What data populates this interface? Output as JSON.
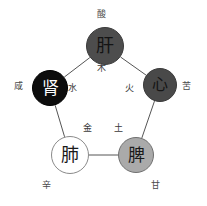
{
  "diagram": {
    "type": "pentagon-cycle",
    "background_color": "#ffffff",
    "line_color": "#555555",
    "nodes": [
      {
        "id": "liver",
        "organ": "肝",
        "element": "木",
        "taste": "酸",
        "fill": "#4d4d4d",
        "text_color": "#141414",
        "stroke": "#3a3a3a",
        "cx": 105,
        "cy": 46,
        "r": 19
      },
      {
        "id": "heart",
        "organ": "心",
        "element": "火",
        "taste": "苦",
        "fill": "#494949",
        "text_color": "#151515",
        "stroke": "#3a3a3a",
        "cx": 160,
        "cy": 85,
        "r": 17
      },
      {
        "id": "spleen",
        "organ": "脾",
        "element": "土",
        "taste": "甘",
        "fill": "#aaaaaa",
        "text_color": "#1a1a1a",
        "stroke": "#707070",
        "cx": 136,
        "cy": 155,
        "r": 18
      },
      {
        "id": "lung",
        "organ": "肺",
        "element": "金",
        "taste": "辛",
        "fill": "#ffffff",
        "text_color": "#1a1a1a",
        "stroke": "#8a8a8a",
        "cx": 70,
        "cy": 155,
        "r": 19
      },
      {
        "id": "kidney",
        "organ": "肾",
        "element": "水",
        "taste": "咸",
        "fill": "#0d0d0d",
        "text_color": "#ffffff",
        "stroke": "#000000",
        "cx": 50,
        "cy": 88,
        "r": 18
      }
    ],
    "edges": [
      {
        "from": "kidney",
        "to": "liver"
      },
      {
        "from": "liver",
        "to": "heart"
      },
      {
        "from": "heart",
        "to": "spleen"
      },
      {
        "from": "lung",
        "to": "spleen"
      },
      {
        "from": "kidney",
        "to": "lung"
      }
    ],
    "element_labels": [
      {
        "id": "wood",
        "text": "木",
        "x": 101,
        "y": 68
      },
      {
        "id": "fire",
        "text": "火",
        "x": 129,
        "y": 88
      },
      {
        "id": "earth",
        "text": "土",
        "x": 118,
        "y": 128
      },
      {
        "id": "metal",
        "text": "金",
        "x": 87,
        "y": 128
      },
      {
        "id": "water",
        "text": "水",
        "x": 72,
        "y": 88
      }
    ],
    "taste_labels": [
      {
        "id": "sour",
        "text": "酸",
        "x": 101,
        "y": 14
      },
      {
        "id": "bitter",
        "text": "苦",
        "x": 186,
        "y": 86
      },
      {
        "id": "sweet",
        "text": "甘",
        "x": 155,
        "y": 185
      },
      {
        "id": "pungent",
        "text": "辛",
        "x": 46,
        "y": 185
      },
      {
        "id": "salty",
        "text": "咸",
        "x": 18,
        "y": 86
      }
    ]
  }
}
